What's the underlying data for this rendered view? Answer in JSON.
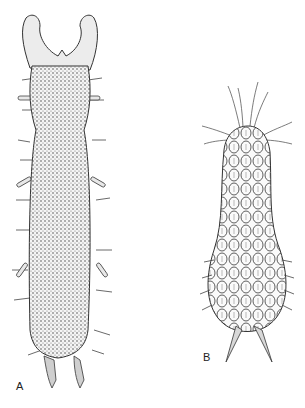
{
  "figure": {
    "panels": [
      {
        "id": "A",
        "label": "A",
        "description": "elongated cylindrical specimen with forked anterior head, stippled body surface, lateral setae and paired appendages"
      },
      {
        "id": "B",
        "label": "B",
        "description": "club-shaped specimen covered in scale-like plates, with long anterior setae and two posterior spines"
      }
    ],
    "colors": {
      "background": "#ffffff",
      "ink": "#2a2a2a",
      "shade": "#9a9a9a"
    }
  }
}
